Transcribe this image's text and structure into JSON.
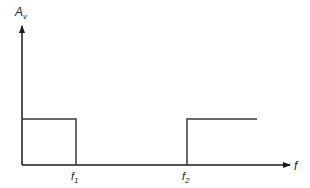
{
  "diagram": {
    "y_axis": {
      "label_main": "A",
      "label_sub": "v"
    },
    "x_axis": {
      "label": "f"
    },
    "markers": [
      {
        "main": "f",
        "sub": "1"
      },
      {
        "main": "f",
        "sub": "2"
      }
    ],
    "colors": {
      "line": "#3a3a3a",
      "axis": "#1a1a1a",
      "text": "#222222"
    }
  }
}
